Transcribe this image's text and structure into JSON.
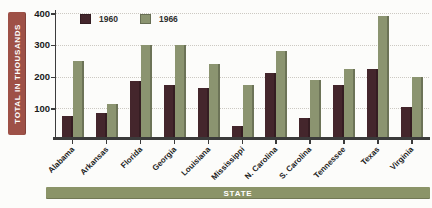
{
  "chart_data": {
    "type": "bar",
    "title": "",
    "xlabel": "STATE",
    "ylabel": "TOTAL IN THOUSANDS",
    "categories": [
      "Alabama",
      "Arkansas",
      "Florida",
      "Georgia",
      "Louisiana",
      "Mississippi",
      "N. Carolina",
      "S. Carolina",
      "Tennessee",
      "Texas",
      "Virginia"
    ],
    "series": [
      {
        "name": "1960",
        "color": "#44262c",
        "values": [
          75,
          85,
          185,
          175,
          165,
          45,
          210,
          70,
          175,
          225,
          105
        ]
      },
      {
        "name": "1966",
        "color": "#8b9470",
        "values": [
          250,
          115,
          300,
          300,
          240,
          175,
          280,
          190,
          225,
          390,
          200
        ]
      }
    ],
    "ylim": [
      0,
      410
    ],
    "yticks": [
      100,
      200,
      300,
      400
    ],
    "grid": "horizontal-dotted",
    "legend_position": "top-left"
  },
  "colors": {
    "ylabel_strip_bg": "#9e5147",
    "xlabel_strip_bg": "#8b9468",
    "axis": "#3b3b3b",
    "gridline": "#ccc9c2",
    "tick_text": "#1a1a1a"
  }
}
